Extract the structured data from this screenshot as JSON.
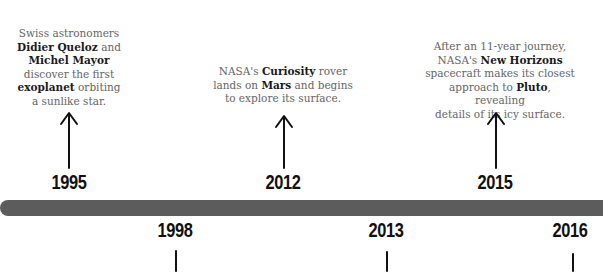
{
  "timeline": {
    "above": [
      {
        "year": "1995",
        "text_parts": [
          {
            "t": "Swiss astronomers ",
            "b": false
          },
          {
            "t": "Didier Queloz",
            "b": true
          },
          {
            "t": " and ",
            "b": false
          },
          {
            "t": "Michel Mayor",
            "b": true
          },
          {
            "t": " discover the first ",
            "b": false
          },
          {
            "t": "exoplanet",
            "b": true
          },
          {
            "t": " orbiting a sunlike star.",
            "b": false
          }
        ]
      },
      {
        "year": "2012",
        "text_parts": [
          {
            "t": "NASA's ",
            "b": false
          },
          {
            "t": "Curiosity",
            "b": true
          },
          {
            "t": " rover lands on ",
            "b": false
          },
          {
            "t": "Mars",
            "b": true
          },
          {
            "t": " and begins to explore its surface.",
            "b": false
          }
        ]
      },
      {
        "year": "2015",
        "text_parts": [
          {
            "t": "After an 11-year journey, NASA's ",
            "b": false
          },
          {
            "t": "New Horizons",
            "b": true
          },
          {
            "t": " spacecraft makes its closest approach to ",
            "b": false
          },
          {
            "t": "Pluto",
            "b": true
          },
          {
            "t": ", revealing details of its icy surface.",
            "b": false
          }
        ]
      }
    ],
    "below": [
      {
        "year": "1998"
      },
      {
        "year": "2013"
      },
      {
        "year": "2016"
      }
    ],
    "bar_color": "#5c5c5c"
  }
}
